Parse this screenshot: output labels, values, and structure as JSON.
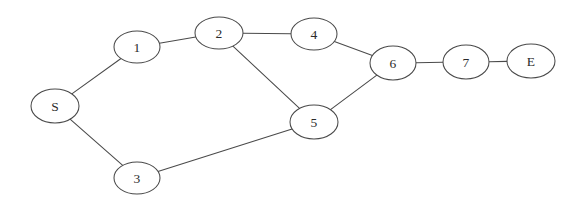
{
  "diagram": {
    "background_color": "#ffffff",
    "stroke_color": "#4a4a4a",
    "label_color": "#2b2b2b",
    "nodes": [
      {
        "id": "S",
        "label": "S",
        "cx": 55,
        "cy": 106,
        "rx": 24,
        "ry": 17
      },
      {
        "id": "1",
        "label": "1",
        "cx": 137,
        "cy": 47,
        "rx": 23,
        "ry": 16
      },
      {
        "id": "2",
        "label": "2",
        "cx": 219,
        "cy": 33,
        "rx": 24,
        "ry": 16
      },
      {
        "id": "3",
        "label": "3",
        "cx": 137,
        "cy": 178,
        "rx": 23,
        "ry": 16
      },
      {
        "id": "4",
        "label": "4",
        "cx": 314,
        "cy": 34,
        "rx": 23,
        "ry": 16
      },
      {
        "id": "5",
        "label": "5",
        "cx": 314,
        "cy": 122,
        "rx": 24,
        "ry": 17
      },
      {
        "id": "6",
        "label": "6",
        "cx": 393,
        "cy": 63,
        "rx": 23,
        "ry": 17
      },
      {
        "id": "7",
        "label": "7",
        "cx": 466,
        "cy": 62,
        "rx": 23,
        "ry": 17
      },
      {
        "id": "E",
        "label": "E",
        "cx": 531,
        "cy": 61,
        "rx": 24,
        "ry": 17
      }
    ],
    "edges": [
      {
        "id": "S-1",
        "from": "S",
        "to": "1"
      },
      {
        "id": "1-2",
        "from": "1",
        "to": "2"
      },
      {
        "id": "2-4",
        "from": "2",
        "to": "4"
      },
      {
        "id": "2-5",
        "from": "2",
        "to": "5"
      },
      {
        "id": "4-6",
        "from": "4",
        "to": "6"
      },
      {
        "id": "5-6",
        "from": "5",
        "to": "6"
      },
      {
        "id": "S-3",
        "from": "S",
        "to": "3"
      },
      {
        "id": "3-5",
        "from": "3",
        "to": "5"
      },
      {
        "id": "6-7",
        "from": "6",
        "to": "7"
      },
      {
        "id": "7-E",
        "from": "7",
        "to": "E"
      }
    ]
  }
}
